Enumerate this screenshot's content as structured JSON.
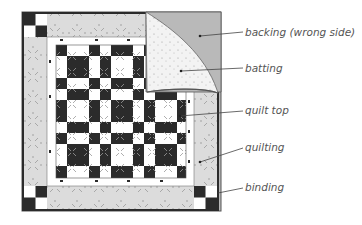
{
  "diagram": {
    "labels": [
      {
        "id": "backing",
        "text": "backing (wrong side)"
      },
      {
        "id": "batting",
        "text": "batting"
      },
      {
        "id": "quilt_top",
        "text": "quilt top"
      },
      {
        "id": "quilting",
        "text": "quilting"
      },
      {
        "id": "binding",
        "text": "binding"
      }
    ],
    "colors": {
      "dark": "#2b2b2b",
      "light": "#ffffff",
      "border_print": "#d9d9d9",
      "backing": "#b9b9b9",
      "batting": "#f2f2f2",
      "label_text": "#555555",
      "leader_line": "#444444"
    }
  }
}
